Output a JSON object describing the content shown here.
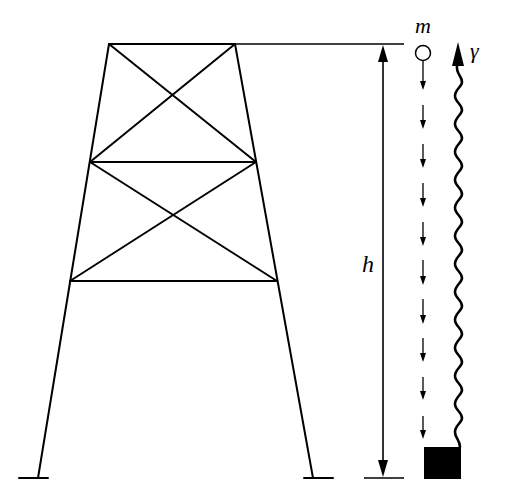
{
  "diagram": {
    "type": "tower-gamma-decay-schematic",
    "labels": {
      "mass": "m",
      "height": "h",
      "photon": "γ"
    },
    "colors": {
      "stroke": "#000000",
      "background": "#ffffff",
      "absorber": "#000000"
    },
    "tower": {
      "panels": 2,
      "cross_braced": true,
      "legs": 2
    },
    "falling_mass_arrows": 10
  }
}
